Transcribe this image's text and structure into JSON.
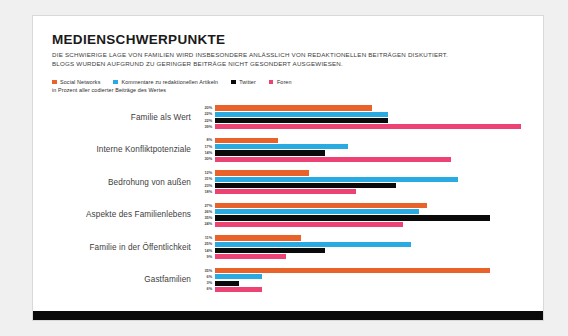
{
  "card": {
    "title": "MEDIENSCHWERPUNKTE",
    "subtitle_line1": "DIE SCHWIERIGE LAGE VON FAMILIEN WIRD INSBESONDERE ANLÄSSLICH VON REDAKTIONELLEN BEITRÄGEN DISKUTIERT.",
    "subtitle_line2": "BLOGS WURDEN AUFGRUND ZU GERINGER BEITRÄGE NICHT GESONDERT AUSGEWIESEN.",
    "legend_note": "in Prozent aller codierter Beiträge des Wertes"
  },
  "colors": {
    "social_networks": "#E8622A",
    "kommentare": "#29ABE2",
    "twitter": "#0A0A0A",
    "foren": "#EC4274",
    "card_background": "#FFFFFF",
    "page_background": "#F0F0F0",
    "bottom_bar": "#0A0A0A"
  },
  "chart_data": {
    "type": "bar",
    "orientation": "horizontal",
    "title": "MEDIENSCHWERPUNKTE",
    "subtitle": "DIE SCHWIERIGE LAGE VON FAMILIEN WIRD INSBESONDERE ANLÄSSLICH VON REDAKTIONELLEN BEITRÄGEN DISKUTIERT. BLOGS WURDEN AUFGRUND ZU GERINGER BEITRÄGE NICHT GESONDERT AUSGEWIESEN.",
    "xlabel": "in Prozent aller codierter Beiträge des Wertes",
    "ylabel": "",
    "xlim": [
      0,
      40
    ],
    "unit": "%",
    "grid": false,
    "legend_position": "top-left",
    "categories": [
      "Familie als Wert",
      "Interne Konfliktpotenziale",
      "Bedrohung von außen",
      "Aspekte des Familienlebens",
      "Familie in der Öffentlichkeit",
      "Gastfamilien"
    ],
    "series": [
      {
        "name": "Social Networks",
        "color": "#E8622A",
        "values": [
          20,
          8,
          12,
          27,
          11,
          35
        ]
      },
      {
        "name": "Kommentare zu redaktionellen Artikeln",
        "color": "#29ABE2",
        "values": [
          22,
          17,
          31,
          26,
          25,
          6
        ]
      },
      {
        "name": "Twitter",
        "color": "#0A0A0A",
        "values": [
          22,
          14,
          23,
          35,
          14,
          3
        ]
      },
      {
        "name": "Foren",
        "color": "#EC4274",
        "values": [
          39,
          30,
          18,
          24,
          9,
          6
        ]
      }
    ],
    "value_labels": [
      [
        "20%",
        "22%",
        "22%",
        "39%"
      ],
      [
        "8%",
        "17%",
        "14%",
        "30%"
      ],
      [
        "12%",
        "31%",
        "23%",
        "18%"
      ],
      [
        "27%",
        "26%",
        "35%",
        "24%"
      ],
      [
        "11%",
        "25%",
        "14%",
        "9%"
      ],
      [
        "35%",
        "6%",
        "3%",
        "6%"
      ]
    ]
  }
}
